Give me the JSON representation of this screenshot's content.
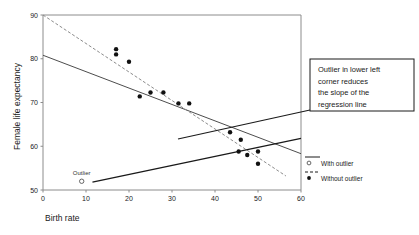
{
  "chart_data": {
    "type": "scatter",
    "title": "",
    "xlabel": "Birth rate",
    "ylabel": "Female life expectancy",
    "xlim": [
      0,
      60
    ],
    "ylim": [
      50,
      90
    ],
    "xticks": [
      0,
      10,
      20,
      30,
      40,
      50,
      60
    ],
    "yticks": [
      50,
      60,
      70,
      80,
      90
    ],
    "grid": false,
    "legend_position": "right",
    "series": [
      {
        "name": "With outlier",
        "marker": "open-circle",
        "line": "solid",
        "points": [
          [
            9,
            52
          ]
        ]
      },
      {
        "name": "Without outlier",
        "marker": "filled-circle",
        "line": "dashed",
        "points": [
          [
            17,
            82.2
          ],
          [
            17,
            81.0
          ],
          [
            20,
            79.3
          ],
          [
            22.5,
            71.4
          ],
          [
            25,
            72.3
          ],
          [
            28,
            72.3
          ],
          [
            31.5,
            69.8
          ],
          [
            34,
            69.8
          ],
          [
            43.5,
            63.2
          ],
          [
            46,
            61.5
          ],
          [
            45.5,
            58.8
          ],
          [
            47.5,
            58.0
          ],
          [
            50,
            58.8
          ],
          [
            50,
            56.0
          ]
        ]
      }
    ],
    "fits": [
      {
        "name": "With outlier",
        "style": "solid",
        "x0": 0,
        "y0": 80.8,
        "x1": 60,
        "y1": 58.3
      },
      {
        "name": "Without outlier",
        "style": "dashed",
        "x0": 0,
        "y0": 90.0,
        "x1": 56.5,
        "y1": 53.2
      },
      {
        "name": "Outlier leverage line",
        "style": "solid-thick",
        "x0": 11.5,
        "y0": 51.8,
        "x1": 60,
        "y1": 61.8
      }
    ],
    "annotations": [
      {
        "name": "outlier-point-label",
        "text": "Outlier",
        "x": 9,
        "y": 53.4
      }
    ]
  },
  "callout": {
    "lines": [
      "Outlier in lower left",
      "corner reduces",
      "the slope of the",
      "regression line"
    ]
  },
  "legend": {
    "entries": [
      {
        "label": "With outlier",
        "marker": "open-circle",
        "line": "solid"
      },
      {
        "label": "Without outlier",
        "marker": "filled-circle",
        "line": "dashed"
      }
    ]
  },
  "colors": {
    "ink": "#1a1a1a",
    "frame": "#8c8c8c",
    "fit_with": "#4d4d4d",
    "fit_without": "#8c8c8c",
    "leader": "#1a1a1a",
    "marker": "#111111",
    "background": "#ffffff"
  }
}
